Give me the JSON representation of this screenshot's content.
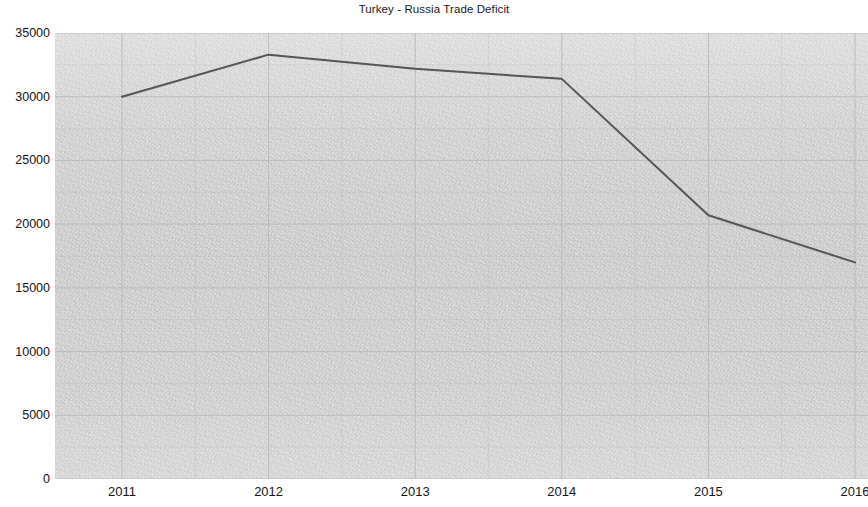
{
  "chart_data": {
    "type": "line",
    "title": "Turkey - Russia Trade Deficit",
    "xlabel": "",
    "ylabel": "",
    "x": [
      2011,
      2012,
      2013,
      2014,
      2015,
      2016
    ],
    "categories": [
      "2011",
      "2012",
      "2013",
      "2014",
      "2015",
      "2016"
    ],
    "series": [
      {
        "name": "Turkey - Russia Trade Deficit",
        "values": [
          30000,
          33300,
          32200,
          31400,
          20700,
          17000
        ],
        "color": "#555555"
      }
    ],
    "xlim": [
      2011,
      2016
    ],
    "ylim": [
      0,
      35000
    ],
    "y_ticks": [
      0,
      5000,
      10000,
      15000,
      20000,
      25000,
      30000,
      35000
    ],
    "y_tick_labels": [
      "0",
      "5000",
      "10000",
      "15000",
      "20000",
      "25000",
      "30000",
      "35000"
    ],
    "x_ticks": [
      2011,
      2012,
      2013,
      2014,
      2015,
      2016
    ],
    "x_tick_labels": [
      "2011",
      "2012",
      "2013",
      "2014",
      "2015",
      "2016"
    ],
    "grid": true,
    "grid_minor": true,
    "legend": false,
    "legend_position": "none",
    "plot_background_color": "#f3f3f3",
    "grid_color": "#b9b9b9",
    "text_color": "#141414"
  }
}
